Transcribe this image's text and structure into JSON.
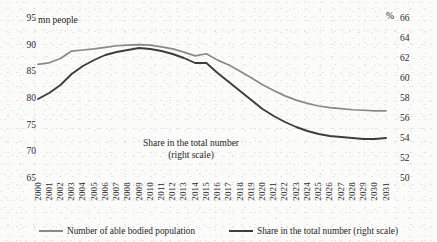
{
  "chart_data": {
    "type": "line",
    "title": "",
    "xlabel": "",
    "ylabel": "mn people",
    "y2label": "%",
    "grid": false,
    "legend_position": "bottom",
    "annotation": {
      "line1": "Share in the total number",
      "line2": "(right scale)"
    },
    "x": [
      2000,
      2001,
      2002,
      2003,
      2004,
      2005,
      2006,
      2007,
      2008,
      2009,
      2010,
      2011,
      2012,
      2013,
      2014,
      2015,
      2016,
      2017,
      2018,
      2019,
      2020,
      2021,
      2022,
      2023,
      2024,
      2025,
      2026,
      2027,
      2028,
      2029,
      2030,
      2031
    ],
    "ylim": [
      65,
      95
    ],
    "yticks": [
      65,
      70,
      75,
      80,
      85,
      90,
      95
    ],
    "y2lim": [
      50,
      66
    ],
    "y2ticks": [
      50,
      52,
      54,
      56,
      58,
      60,
      62,
      64,
      66
    ],
    "series": [
      {
        "name": "Number of able bodied population",
        "axis": "left",
        "color": "#8a8a8a",
        "values": [
          86.3,
          86.6,
          87.4,
          88.8,
          89.0,
          89.2,
          89.5,
          89.8,
          89.9,
          90.0,
          89.9,
          89.6,
          89.2,
          88.6,
          87.9,
          88.3,
          87.1,
          86.2,
          85.0,
          83.8,
          82.5,
          81.4,
          80.4,
          79.6,
          79.0,
          78.5,
          78.2,
          78.0,
          77.8,
          77.7,
          77.6,
          77.6
        ]
      },
      {
        "name": "Share in the total number (right scale)",
        "axis": "right",
        "color": "#3d3d3d",
        "values": [
          57.9,
          58.5,
          59.3,
          60.4,
          61.2,
          61.8,
          62.3,
          62.6,
          62.8,
          63.0,
          62.9,
          62.7,
          62.4,
          62.0,
          61.5,
          61.5,
          60.5,
          59.6,
          58.7,
          57.8,
          56.9,
          56.2,
          55.6,
          55.1,
          54.7,
          54.4,
          54.2,
          54.1,
          54.0,
          53.9,
          53.9,
          54.0
        ]
      }
    ]
  },
  "legend": [
    {
      "label": "Number of able bodied population",
      "color": "#8a8a8a"
    },
    {
      "label": "Share in the total number (right scale)",
      "color": "#3d3d3d"
    }
  ]
}
